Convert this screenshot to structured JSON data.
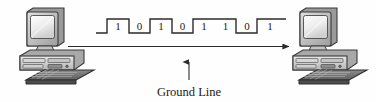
{
  "diagram": {
    "background_color": "#fefefe",
    "ink_color": "#2b2b2b",
    "bit_stream": {
      "digits": [
        "1",
        "0",
        "1",
        "0",
        "1",
        "1",
        "0",
        "1"
      ],
      "levels": [
        1,
        0,
        1,
        0,
        1,
        1,
        0,
        1
      ],
      "lead_in_level": 0,
      "description": "Digital square waveform carrying the bit pattern 1 0 1 0 1 1 0 1"
    },
    "ground_line": {
      "label": "Ground Line",
      "direction": "left-to-right",
      "arrow": "right-arrowhead"
    },
    "callout": {
      "label": "Ground Line",
      "pointer": "up-arrow"
    },
    "nodes": [
      {
        "id": "left-computer",
        "label": "",
        "parts": [
          "monitor",
          "desktop-case",
          "keyboard"
        ]
      },
      {
        "id": "right-computer",
        "label": "",
        "parts": [
          "monitor",
          "desktop-case",
          "keyboard"
        ]
      }
    ]
  }
}
